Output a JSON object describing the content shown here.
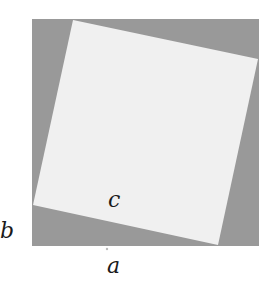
{
  "diagram": {
    "type": "pythagorean-square-proof",
    "outer_square": {
      "x": 32,
      "y": 19,
      "size": 227,
      "color": "#999999"
    },
    "inner_square": {
      "vertices": [
        [
          73,
          20
        ],
        [
          258,
          59
        ],
        [
          218,
          245
        ],
        [
          33,
          205
        ]
      ],
      "color": "#f0f0f0"
    },
    "labels": {
      "a": "a",
      "b": "b",
      "c": "c"
    }
  }
}
